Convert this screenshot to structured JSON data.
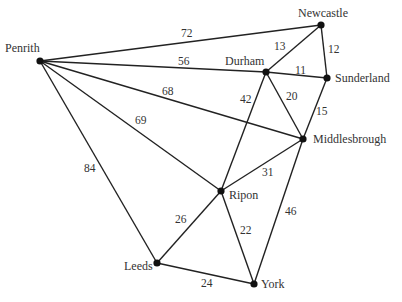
{
  "graph": {
    "nodes": [
      {
        "id": "penrith",
        "label": "Penrith",
        "x": 40,
        "y": 61,
        "lx": 5,
        "ly": 52,
        "anchor": "start"
      },
      {
        "id": "newcastle",
        "label": "Newcastle",
        "x": 321,
        "y": 25,
        "lx": 298,
        "ly": 17,
        "anchor": "start"
      },
      {
        "id": "durham",
        "label": "Durham",
        "x": 266,
        "y": 72,
        "lx": 225,
        "ly": 65,
        "anchor": "start"
      },
      {
        "id": "sunderland",
        "label": "Sunderland",
        "x": 327,
        "y": 78,
        "lx": 335,
        "ly": 82,
        "anchor": "start"
      },
      {
        "id": "middlesbrough",
        "label": "Middlesbrough",
        "x": 303,
        "y": 139,
        "lx": 313,
        "ly": 143,
        "anchor": "start"
      },
      {
        "id": "ripon",
        "label": "Ripon",
        "x": 221,
        "y": 191,
        "lx": 229,
        "ly": 199,
        "anchor": "start"
      },
      {
        "id": "leeds",
        "label": "Leeds",
        "x": 157,
        "y": 263,
        "lx": 124,
        "ly": 270,
        "anchor": "start"
      },
      {
        "id": "york",
        "label": "York",
        "x": 254,
        "y": 284,
        "lx": 261,
        "ly": 288,
        "anchor": "start"
      }
    ],
    "edges": [
      {
        "from": "penrith",
        "to": "newcastle",
        "weight": "72",
        "lx": 181,
        "ly": 37
      },
      {
        "from": "penrith",
        "to": "durham",
        "weight": "56",
        "lx": 178,
        "ly": 65
      },
      {
        "from": "penrith",
        "to": "middlesbrough",
        "weight": "68",
        "lx": 162,
        "ly": 95
      },
      {
        "from": "penrith",
        "to": "ripon",
        "weight": "69",
        "lx": 135,
        "ly": 124
      },
      {
        "from": "penrith",
        "to": "leeds",
        "weight": "84",
        "lx": 84,
        "ly": 172
      },
      {
        "from": "newcastle",
        "to": "durham",
        "weight": "13",
        "lx": 274,
        "ly": 50
      },
      {
        "from": "newcastle",
        "to": "sunderland",
        "weight": "12",
        "lx": 328,
        "ly": 53
      },
      {
        "from": "durham",
        "to": "sunderland",
        "weight": "11",
        "lx": 295,
        "ly": 74
      },
      {
        "from": "durham",
        "to": "middlesbrough",
        "weight": "20",
        "lx": 286,
        "ly": 100
      },
      {
        "from": "durham",
        "to": "ripon",
        "weight": "42",
        "lx": 240,
        "ly": 103
      },
      {
        "from": "sunderland",
        "to": "middlesbrough",
        "weight": "15",
        "lx": 316,
        "ly": 115
      },
      {
        "from": "middlesbrough",
        "to": "ripon",
        "weight": "31",
        "lx": 262,
        "ly": 176
      },
      {
        "from": "middlesbrough",
        "to": "york",
        "weight": "46",
        "lx": 285,
        "ly": 215
      },
      {
        "from": "ripon",
        "to": "leeds",
        "weight": "26",
        "lx": 175,
        "ly": 223
      },
      {
        "from": "ripon",
        "to": "york",
        "weight": "22",
        "lx": 240,
        "ly": 234
      },
      {
        "from": "leeds",
        "to": "york",
        "weight": "24",
        "lx": 201,
        "ly": 287
      }
    ]
  }
}
